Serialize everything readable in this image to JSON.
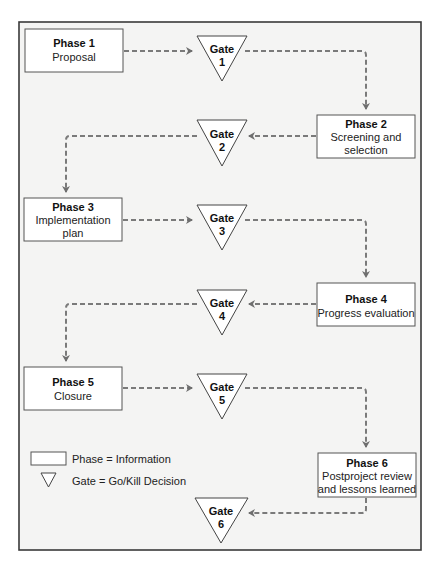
{
  "diagram": {
    "phases": [
      {
        "id": "phase-1",
        "title": "Phase 1",
        "lines": [
          "Proposal"
        ]
      },
      {
        "id": "phase-2",
        "title": "Phase 2",
        "lines": [
          "Screening and",
          "selection"
        ]
      },
      {
        "id": "phase-3",
        "title": "Phase 3",
        "lines": [
          "Implementation",
          "plan"
        ]
      },
      {
        "id": "phase-4",
        "title": "Phase 4",
        "lines": [
          "Progress evaluation"
        ]
      },
      {
        "id": "phase-5",
        "title": "Phase 5",
        "lines": [
          "Closure"
        ]
      },
      {
        "id": "phase-6",
        "title": "Phase 6",
        "lines": [
          "Postproject review",
          "and lessons learned"
        ]
      }
    ],
    "gates": [
      {
        "id": "gate-1",
        "label": "Gate",
        "number": "1"
      },
      {
        "id": "gate-2",
        "label": "Gate",
        "number": "2"
      },
      {
        "id": "gate-3",
        "label": "Gate",
        "number": "3"
      },
      {
        "id": "gate-4",
        "label": "Gate",
        "number": "4"
      },
      {
        "id": "gate-5",
        "label": "Gate",
        "number": "5"
      },
      {
        "id": "gate-6",
        "label": "Gate",
        "number": "6"
      }
    ],
    "flow": [
      "Phase 1 -> Gate 1",
      "Gate 1 -> Phase 2",
      "Phase 2 -> Gate 2",
      "Gate 2 -> Phase 3",
      "Phase 3 -> Gate 3",
      "Gate 3 -> Phase 4",
      "Phase 4 -> Gate 4",
      "Gate 4 -> Phase 5",
      "Phase 5 -> Gate 5",
      "Gate 5 -> Phase 6",
      "Phase 6 -> Gate 6"
    ],
    "legend": {
      "phase": "Phase = Information",
      "gate": "Gate = Go/Kill Decision"
    },
    "colors": {
      "frame_fill": "#f4f4f3",
      "frame_stroke": "#3a3a3a",
      "arrow": "#7a7a7a"
    }
  }
}
